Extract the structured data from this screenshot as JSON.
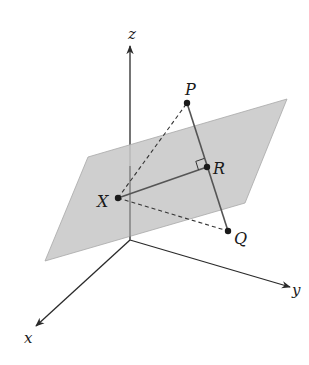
{
  "figure": {
    "width": 309,
    "height": 365,
    "colors": {
      "background": "#ffffff",
      "plane_fill": "#c8c8c8",
      "plane_stroke": "#a8a8a8",
      "axis": "#2a2a2a",
      "axis_behind_plane": "#6a6a6a",
      "segment": "#555555",
      "point": "#1a1a1a",
      "label": "#1a1a1a"
    },
    "axes": {
      "origin": [
        130,
        240
      ],
      "z": {
        "label": "z",
        "end": [
          130,
          46
        ],
        "label_pos": [
          128,
          39
        ]
      },
      "x": {
        "label": "x",
        "end": [
          36,
          326
        ],
        "label_pos": [
          24,
          343
        ]
      },
      "y": {
        "label": "y",
        "end": [
          290,
          287
        ],
        "label_pos": [
          292,
          295
        ]
      }
    },
    "plane": {
      "vertices": [
        [
          45,
          261
        ],
        [
          88,
          157
        ],
        [
          287,
          99
        ],
        [
          245,
          203
        ]
      ]
    },
    "points": [
      {
        "name": "P",
        "pos": [
          187,
          103
        ],
        "label": "P",
        "label_pos": [
          185,
          95
        ]
      },
      {
        "name": "R",
        "pos": [
          207,
          167
        ],
        "label": "R",
        "label_pos": [
          213,
          174
        ]
      },
      {
        "name": "X",
        "pos": [
          118,
          198
        ],
        "label": "X",
        "label_pos": [
          97,
          207
        ]
      },
      {
        "name": "Q",
        "pos": [
          228,
          231
        ],
        "label": "Q",
        "label_pos": [
          234,
          244
        ]
      }
    ],
    "segments": [
      {
        "from": "P",
        "to": "Q",
        "style": "solid"
      },
      {
        "from": "X",
        "to": "R",
        "style": "solid"
      },
      {
        "from": "X",
        "to": "P",
        "style": "dashed"
      },
      {
        "from": "X",
        "to": "Q",
        "style": "dashed"
      }
    ],
    "right_angle_marker": {
      "at": "R",
      "size": 9
    }
  }
}
